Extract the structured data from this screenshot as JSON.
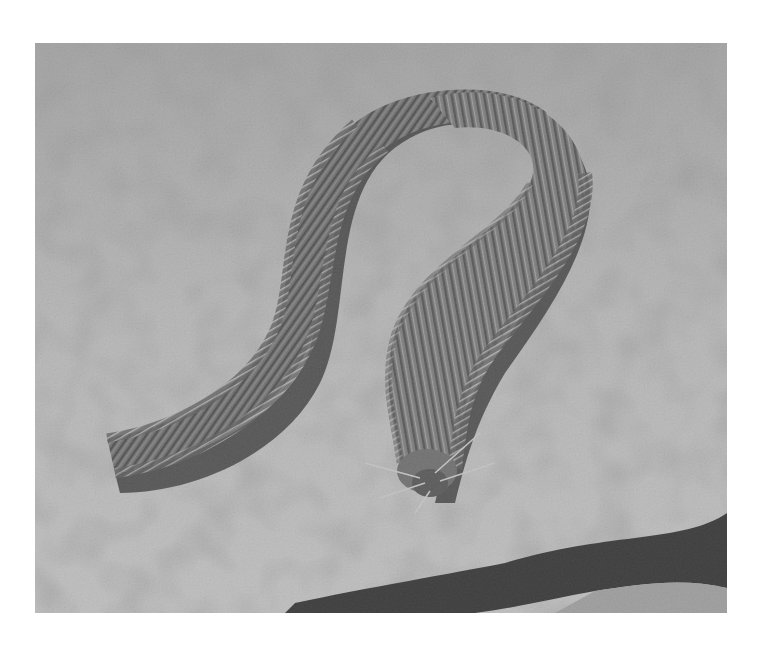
{
  "image": {
    "subject": "Bristle worm (polychaete) crawling on sandy seafloor",
    "style": "grayscale photograph",
    "background_color": "#ffffff",
    "frame": {
      "left": 35,
      "top": 43,
      "width": 692,
      "height": 570
    },
    "palette": {
      "sand_light": "#c4c4c4",
      "sand_mid": "#a9a9a9",
      "sand_dark": "#7d7d7d",
      "worm_body": "#5e5e5e",
      "worm_dark": "#2e2e2e",
      "shadow": "#0e0e0e"
    },
    "caption": "Bristle worm on sand"
  }
}
